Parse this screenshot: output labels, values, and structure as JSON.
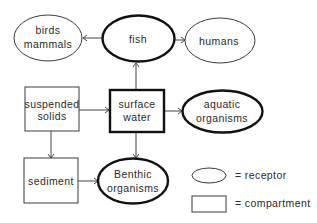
{
  "diagram": {
    "nodes": {
      "birds_mammals": {
        "line1": "birds",
        "line2": "mammals",
        "shape": "ellipse",
        "style": "thin"
      },
      "fish": {
        "label": "fish",
        "shape": "ellipse",
        "style": "thick"
      },
      "humans": {
        "label": "humans",
        "shape": "ellipse",
        "style": "thin"
      },
      "suspended_solids": {
        "line1": "suspended",
        "line2": "solids",
        "shape": "rectangle",
        "style": "thin"
      },
      "surface_water": {
        "line1": "surface",
        "line2": "water",
        "shape": "rectangle",
        "style": "thick"
      },
      "aquatic_organisms": {
        "line1": "aquatic",
        "line2": "organisms",
        "shape": "ellipse",
        "style": "thick"
      },
      "sediment": {
        "label": "sediment",
        "shape": "rectangle",
        "style": "thin"
      },
      "benthic_organisms": {
        "line1": "Benthic",
        "line2": "organisms",
        "shape": "ellipse",
        "style": "thick"
      }
    },
    "edges": [
      {
        "from": "fish",
        "to": "birds_mammals"
      },
      {
        "from": "fish",
        "to": "humans"
      },
      {
        "from": "surface_water",
        "to": "fish"
      },
      {
        "from": "suspended_solids",
        "to": "surface_water"
      },
      {
        "from": "surface_water",
        "to": "aquatic_organisms"
      },
      {
        "from": "suspended_solids",
        "to": "sediment"
      },
      {
        "from": "surface_water",
        "to": "benthic_organisms"
      },
      {
        "from": "sediment",
        "to": "benthic_organisms"
      }
    ],
    "legend": {
      "receptor": {
        "symbol": "ellipse",
        "label": "= receptor"
      },
      "compartment": {
        "symbol": "rectangle",
        "label": "= compartment"
      }
    }
  }
}
